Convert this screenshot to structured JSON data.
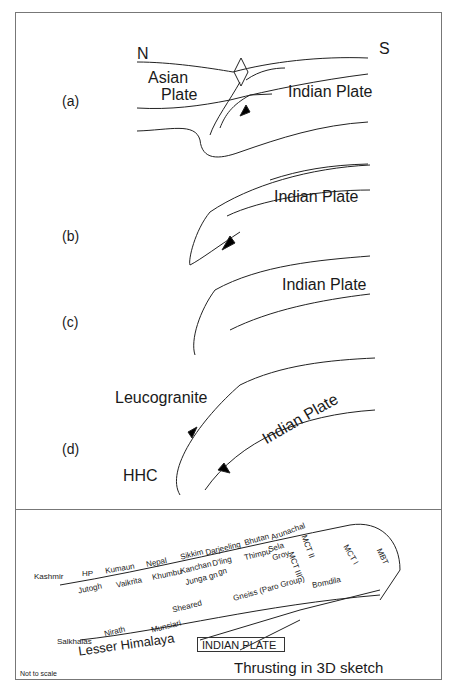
{
  "panels": [
    {
      "id": "a",
      "label": "(a)",
      "texts": {
        "north": "N",
        "south": "S",
        "asian1": "Asian",
        "asian2": "Plate",
        "indian": "Indian Plate"
      }
    },
    {
      "id": "b",
      "label": "(b)",
      "texts": {
        "indian": "Indian Plate"
      }
    },
    {
      "id": "c",
      "label": "(c)",
      "texts": {
        "indian": "Indian Plate"
      }
    },
    {
      "id": "d",
      "label": "(d)",
      "texts": {
        "leuco": "Leucogranite",
        "indian": "Indian Plate",
        "hhc": "HHC"
      }
    }
  ],
  "sketch3d": {
    "regions": [
      "Kashmir",
      "HP",
      "Kumaun",
      "Nepal",
      "Sikkim",
      "Darjeeling",
      "Bhutan",
      "Arunachal"
    ],
    "units_upper": [
      "Jutogh",
      "Vaikrita",
      "Khumbu",
      "Kanchan",
      "D'ling",
      "Thimpu",
      "Sela"
    ],
    "units_lower": [
      "Junga gn",
      "gn",
      "Groy"
    ],
    "faults": [
      "MCT II",
      "MCT III",
      "MCT I",
      "MBT"
    ],
    "other": {
      "gneiss": "Gneiss (Paro Group)",
      "bomdila": "Bomdila",
      "sheared": "Sheared",
      "munsiari": "Munsiari",
      "nirath": "Nirath",
      "salkhalas": "Salkhalas",
      "lesser": "Lesser Himalaya",
      "indian_plate": "INDIAN PLATE"
    },
    "not_to_scale": "Not to scale",
    "title": "Thrusting in 3D sketch"
  }
}
